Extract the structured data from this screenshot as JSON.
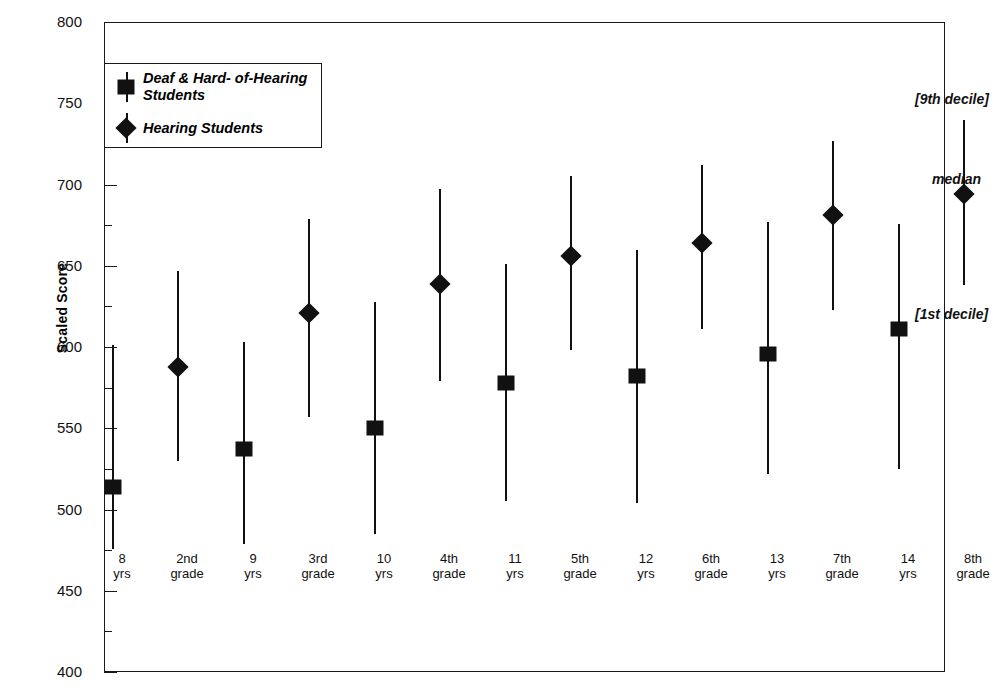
{
  "chart_data": {
    "type": "scatter",
    "title": "",
    "xlabel": "",
    "ylabel": "Scaled Score",
    "ylim": [
      400,
      800
    ],
    "ytick_step": 50,
    "yminor_step": 25,
    "ytick_labels": [
      "800",
      "750",
      "700",
      "650",
      "600",
      "550",
      "500",
      "450",
      "400"
    ],
    "ytick_values": [
      800,
      750,
      700,
      650,
      600,
      550,
      500,
      450,
      400
    ],
    "grid": false,
    "legend_position": "top-left",
    "categories": [
      "8 yrs",
      "2nd grade",
      "9 yrs",
      "3rd grade",
      "10 yrs",
      "4th grade",
      "11 yrs",
      "5th grade",
      "12 yrs",
      "6th grade",
      "13 yrs",
      "7th grade",
      "14 yrs",
      "8th grade",
      "15 yrs",
      "9th grade"
    ],
    "category_labels": [
      {
        "line1": "8",
        "line2": "yrs"
      },
      {
        "line1": "2nd",
        "line2": "grade"
      },
      {
        "line1": "9",
        "line2": "yrs"
      },
      {
        "line1": "3rd",
        "line2": "grade"
      },
      {
        "line1": "10",
        "line2": "yrs"
      },
      {
        "line1": "4th",
        "line2": "grade"
      },
      {
        "line1": "11",
        "line2": "yrs"
      },
      {
        "line1": "5th",
        "line2": "grade"
      },
      {
        "line1": "12",
        "line2": "yrs"
      },
      {
        "line1": "6th",
        "line2": "grade"
      },
      {
        "line1": "13",
        "line2": "yrs"
      },
      {
        "line1": "7th",
        "line2": "grade"
      },
      {
        "line1": "14",
        "line2": "yrs"
      },
      {
        "line1": "8th",
        "line2": "grade"
      },
      {
        "line1": "15",
        "line2": "yrs"
      },
      {
        "line1": "9th",
        "line2": "grade"
      }
    ],
    "series": [
      {
        "name": "Deaf & Hard- of-Hearing Students",
        "marker": "square",
        "color": "#111111",
        "points": [
          {
            "category": "8 yrs",
            "decile1": 476,
            "median": 514,
            "decile9": 601
          },
          {
            "category": "9 yrs",
            "decile1": 479,
            "median": 537,
            "decile9": 603
          },
          {
            "category": "10 yrs",
            "decile1": 485,
            "median": 550,
            "decile9": 628
          },
          {
            "category": "11 yrs",
            "decile1": 505,
            "median": 578,
            "decile9": 651
          },
          {
            "category": "12 yrs",
            "decile1": 504,
            "median": 582,
            "decile9": 660
          },
          {
            "category": "13 yrs",
            "decile1": 522,
            "median": 596,
            "decile9": 677
          },
          {
            "category": "14 yrs",
            "decile1": 525,
            "median": 611,
            "decile9": 676
          },
          {
            "category": "15 yrs",
            "decile1": 548,
            "median": 622,
            "decile9": 691
          }
        ]
      },
      {
        "name": "Hearing Students",
        "marker": "diamond",
        "color": "#111111",
        "points": [
          {
            "category": "2nd grade",
            "decile1": 530,
            "median": 588,
            "decile9": 647
          },
          {
            "category": "3rd grade",
            "decile1": 557,
            "median": 621,
            "decile9": 679
          },
          {
            "category": "4th grade",
            "decile1": 579,
            "median": 639,
            "decile9": 697
          },
          {
            "category": "5th grade",
            "decile1": 598,
            "median": 656,
            "decile9": 705
          },
          {
            "category": "6th grade",
            "decile1": 611,
            "median": 664,
            "decile9": 712
          },
          {
            "category": "7th grade",
            "decile1": 623,
            "median": 681,
            "decile9": 727
          },
          {
            "category": "8th grade",
            "decile1": 638,
            "median": 694,
            "decile9": 740
          },
          {
            "category": "9th grade",
            "decile1": 652,
            "median": 703,
            "decile9": 752
          }
        ]
      }
    ],
    "annotations": [
      {
        "text": "[9th decile]",
        "value": 752
      },
      {
        "text": "median",
        "value": 703
      },
      {
        "text": "[1st decile]",
        "value": 620
      }
    ]
  },
  "legend": {
    "items": [
      {
        "label": "Deaf & Hard- of-Hearing\nStudents",
        "marker": "square"
      },
      {
        "label": "Hearing Students",
        "marker": "diamond"
      }
    ]
  }
}
